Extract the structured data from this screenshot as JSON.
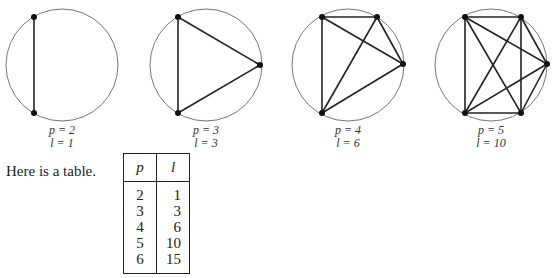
{
  "figures": [
    {
      "p": "2",
      "l": "1",
      "p_label": "p = 2",
      "l_label": "l = 1"
    },
    {
      "p": "3",
      "l": "3",
      "p_label": "p = 3",
      "l_label": "l = 3"
    },
    {
      "p": "4",
      "l": "6",
      "p_label": "p = 4",
      "l_label": "l = 6"
    },
    {
      "p": "5",
      "l": "10",
      "p_label": "p = 5",
      "l_label": "l = 10"
    }
  ],
  "intro_text": "Here is a table.",
  "table": {
    "headers": [
      "p",
      "l"
    ],
    "rows": [
      [
        "2",
        "1"
      ],
      [
        "3",
        "3"
      ],
      [
        "4",
        "6"
      ],
      [
        "5",
        "10"
      ],
      [
        "6",
        "15"
      ]
    ]
  }
}
